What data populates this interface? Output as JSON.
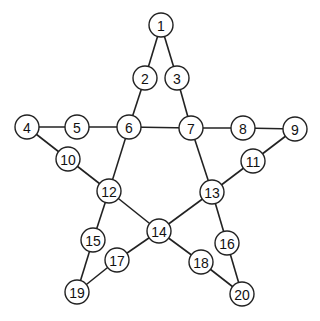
{
  "diagram": {
    "type": "graph",
    "shape": "pentagram",
    "node_radius": 12,
    "colors": {
      "stroke": "#222222",
      "fill": "#ffffff",
      "text": "#111111",
      "background": "#ffffff"
    },
    "nodes": [
      {
        "id": "1",
        "label": "1",
        "x": 161,
        "y": 25
      },
      {
        "id": "2",
        "label": "2",
        "x": 145,
        "y": 78
      },
      {
        "id": "3",
        "label": "3",
        "x": 177,
        "y": 78
      },
      {
        "id": "4",
        "label": "4",
        "x": 27,
        "y": 127
      },
      {
        "id": "5",
        "label": "5",
        "x": 77,
        "y": 127
      },
      {
        "id": "6",
        "label": "6",
        "x": 129,
        "y": 127
      },
      {
        "id": "7",
        "label": "7",
        "x": 191,
        "y": 128
      },
      {
        "id": "8",
        "label": "8",
        "x": 243,
        "y": 128
      },
      {
        "id": "9",
        "label": "9",
        "x": 295,
        "y": 129
      },
      {
        "id": "10",
        "label": "10",
        "x": 68,
        "y": 159
      },
      {
        "id": "11",
        "label": "11",
        "x": 253,
        "y": 161
      },
      {
        "id": "12",
        "label": "12",
        "x": 109,
        "y": 191
      },
      {
        "id": "13",
        "label": "13",
        "x": 212,
        "y": 192
      },
      {
        "id": "14",
        "label": "14",
        "x": 159,
        "y": 231
      },
      {
        "id": "15",
        "label": "15",
        "x": 93,
        "y": 240
      },
      {
        "id": "16",
        "label": "16",
        "x": 227,
        "y": 243
      },
      {
        "id": "17",
        "label": "17",
        "x": 117,
        "y": 260
      },
      {
        "id": "18",
        "label": "18",
        "x": 201,
        "y": 262
      },
      {
        "id": "19",
        "label": "19",
        "x": 77,
        "y": 292
      },
      {
        "id": "20",
        "label": "20",
        "x": 242,
        "y": 294
      }
    ],
    "edges": [
      [
        "1",
        "2"
      ],
      [
        "1",
        "3"
      ],
      [
        "2",
        "6"
      ],
      [
        "3",
        "7"
      ],
      [
        "4",
        "5"
      ],
      [
        "5",
        "6"
      ],
      [
        "6",
        "7"
      ],
      [
        "7",
        "8"
      ],
      [
        "8",
        "9"
      ],
      [
        "4",
        "10"
      ],
      [
        "10",
        "12"
      ],
      [
        "9",
        "11"
      ],
      [
        "11",
        "13"
      ],
      [
        "6",
        "12"
      ],
      [
        "7",
        "13"
      ],
      [
        "12",
        "14"
      ],
      [
        "13",
        "14"
      ],
      [
        "12",
        "15"
      ],
      [
        "15",
        "19"
      ],
      [
        "19",
        "17"
      ],
      [
        "17",
        "14"
      ],
      [
        "14",
        "18"
      ],
      [
        "18",
        "20"
      ],
      [
        "13",
        "16"
      ],
      [
        "16",
        "20"
      ]
    ]
  }
}
